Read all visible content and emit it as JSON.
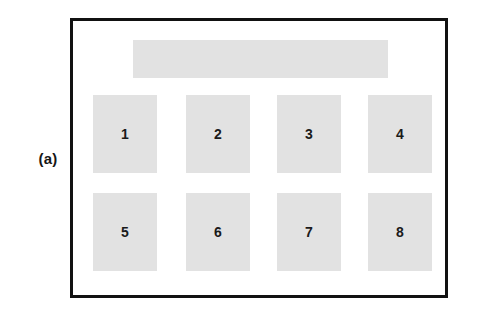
{
  "figure": {
    "panel_label": "(a)",
    "frame": {
      "border_color": "#111111",
      "background_color": "#ffffff"
    },
    "header_band": {
      "label": "",
      "fill_color": "#e2e2e2"
    },
    "block_fill_color": "#e2e2e2",
    "block_text_color": "#1a1a1a",
    "blocks": [
      {
        "label": "1",
        "row": 1,
        "column": 1
      },
      {
        "label": "2",
        "row": 1,
        "column": 2
      },
      {
        "label": "3",
        "row": 1,
        "column": 3
      },
      {
        "label": "4",
        "row": 1,
        "column": 4
      },
      {
        "label": "5",
        "row": 2,
        "column": 1
      },
      {
        "label": "6",
        "row": 2,
        "column": 2
      },
      {
        "label": "7",
        "row": 2,
        "column": 3
      },
      {
        "label": "8",
        "row": 2,
        "column": 4
      }
    ]
  }
}
